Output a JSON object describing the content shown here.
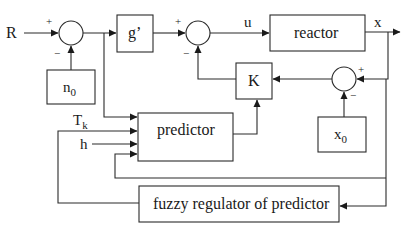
{
  "diagram": {
    "type": "block-diagram",
    "inputs": {
      "R": "R",
      "Tk_main": "T",
      "Tk_sub": "k",
      "h": "h"
    },
    "blocks": {
      "n0_main": "n",
      "n0_sub": "0",
      "g_prime": "g’",
      "reactor": "reactor",
      "K": "K",
      "x0_main": "x",
      "x0_sub": "0",
      "predictor": "predictor",
      "fuzzy_regulator": "fuzzy regulator of predictor"
    },
    "signals": {
      "u": "u",
      "x": "x"
    },
    "junction_signs": {
      "sum1_plus": "+",
      "sum1_minus": "−",
      "sum2_plus": "+",
      "sum2_minus": "−",
      "sum3_plus": "+",
      "sum3_minus": "−"
    }
  }
}
